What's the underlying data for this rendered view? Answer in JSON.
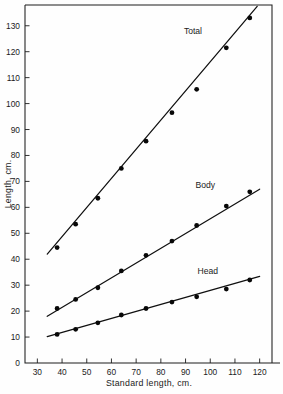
{
  "figure": {
    "name": "length-regression-figure",
    "background_color": "#fefefe",
    "ink_color": "#151515"
  },
  "chart_data": {
    "type": "scatter",
    "title": "",
    "subtitle": "",
    "xlabel": "Standard length, cm.",
    "ylabel": "Length, cm.",
    "xlim": [
      25,
      125
    ],
    "ylim": [
      0,
      138
    ],
    "grid": false,
    "legend_position": "inline-right",
    "xticks": [
      30,
      40,
      50,
      60,
      70,
      80,
      90,
      100,
      110,
      120
    ],
    "xticklabels": [
      "30",
      "40",
      "50",
      "60",
      "70",
      "80",
      "90",
      "100",
      "110",
      "120"
    ],
    "yticks": [
      0,
      10,
      20,
      30,
      40,
      50,
      60,
      70,
      80,
      90,
      100,
      110,
      120,
      130
    ],
    "yticklabels": [
      "0",
      "10",
      "20",
      "30",
      "40",
      "50",
      "60",
      "70",
      "80",
      "90",
      "100",
      "110",
      "120",
      "130"
    ],
    "series": [
      {
        "name": "Total",
        "label": "Total",
        "marker": "filled-circle",
        "fit": "linear",
        "x": [
          38,
          45.5,
          54.5,
          64,
          74,
          84.5,
          94.5,
          106.5,
          116
        ],
        "y": [
          44.5,
          53.5,
          63.5,
          75,
          85.5,
          96.5,
          105.5,
          121.5,
          133
        ],
        "fit_x": [
          34,
          119
        ],
        "fit_y": [
          42,
          137.5
        ]
      },
      {
        "name": "Body",
        "label": "Body",
        "marker": "filled-circle",
        "fit": "linear",
        "x": [
          38,
          45.5,
          54.5,
          64,
          74,
          84.5,
          94.5,
          106.5,
          116
        ],
        "y": [
          21,
          24.5,
          29,
          35.5,
          41.5,
          47,
          53,
          60.5,
          66
        ],
        "fit_x": [
          34,
          120
        ],
        "fit_y": [
          18,
          67
        ]
      },
      {
        "name": "Head",
        "label": "Head",
        "marker": "filled-circle",
        "fit": "linear",
        "x": [
          38,
          45.5,
          54.5,
          64,
          74,
          84.5,
          94.5,
          106.5,
          116
        ],
        "y": [
          11,
          13,
          15.5,
          18.5,
          21,
          23.5,
          25.5,
          28.5,
          32
        ],
        "fit_x": [
          34,
          120
        ],
        "fit_y": [
          10.2,
          33.4
        ]
      }
    ],
    "series_label_positions": [
      {
        "label": "Total",
        "x": 93,
        "y": 127
      },
      {
        "label": "Body",
        "x": 98,
        "y": 67.5
      },
      {
        "label": "Head",
        "x": 99,
        "y": 34.5
      }
    ]
  }
}
